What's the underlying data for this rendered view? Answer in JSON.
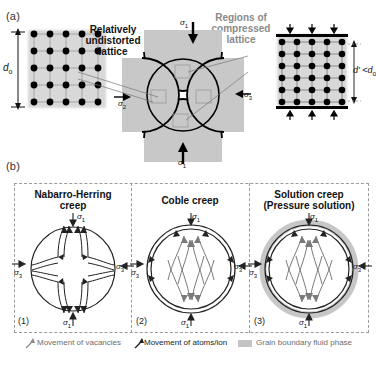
{
  "figure": {
    "panel_a_letter": "(a)",
    "panel_b_letter": "(b)"
  },
  "panel_a": {
    "left_lattice": {
      "name": "undistorted-lattice",
      "dimension_label": "d",
      "dimension_sub": "o",
      "rows": 5,
      "cols": 5
    },
    "right_lattice": {
      "name": "compressed-lattice",
      "dimension_label": "d' <d",
      "dimension_sub": "o",
      "rows": 6,
      "cols": 5
    },
    "annotations": [
      {
        "id": "undistorted",
        "text": "Relatively\nundistorted\nlattice",
        "line1": "Relatively",
        "line2": "undistorted",
        "line3": "lattice",
        "color": "#111111"
      },
      {
        "id": "compressed",
        "text": "Regions of\ncompressed\nlattice",
        "line1": "Regions of",
        "line2": "compressed",
        "line3": "lattice",
        "color": "#8a8a8a"
      }
    ],
    "stresses": {
      "sigma1_top": "σ1",
      "sigma1_bottom": "σ1",
      "sigma2_left": "σ2",
      "sigma3_right": "σ3"
    }
  },
  "panel_b": {
    "diagrams": [
      {
        "number": "(1)",
        "title_line1": "Nabarro-Herring",
        "title_line2": "creep",
        "sigma1_top": "σ1",
        "sigma1_bottom": "σ1",
        "sigma3_left": "σ3",
        "sigma3_right": "σ3",
        "boundary": "single",
        "fluid": false
      },
      {
        "number": "(2)",
        "title_line1": "Coble creep",
        "title_line2": "",
        "sigma1_top": "σ1",
        "sigma1_bottom": "σ1",
        "sigma3_left": "σ3",
        "sigma3_right": "σ3",
        "boundary": "double",
        "fluid": false
      },
      {
        "number": "(3)",
        "title_line1": "Solution creep",
        "title_line2": "(Pressure solution)",
        "sigma1_top": "σ1",
        "sigma1_bottom": "σ1",
        "sigma3_left": "σ3",
        "sigma3_right": "σ3",
        "boundary": "double",
        "fluid": true
      }
    ],
    "legend": [
      {
        "icon": "gray-curved-arrow-icon",
        "label": "Movement of vacancies",
        "color": "#8a8a8a"
      },
      {
        "icon": "black-curved-arrow-icon",
        "label": "Movement of atoms/ion",
        "color": "#222222"
      },
      {
        "icon": "gray-swatch-icon",
        "label": "Grain boundary fluid phase",
        "color": "#6e6e6e"
      }
    ]
  },
  "colors": {
    "gray_text": "#8a8a8a",
    "dark_text": "#111111",
    "shade_gray": "#c8c8c8",
    "grid_gray": "#9a9a9a",
    "dash_border": "#9a9a9a"
  }
}
